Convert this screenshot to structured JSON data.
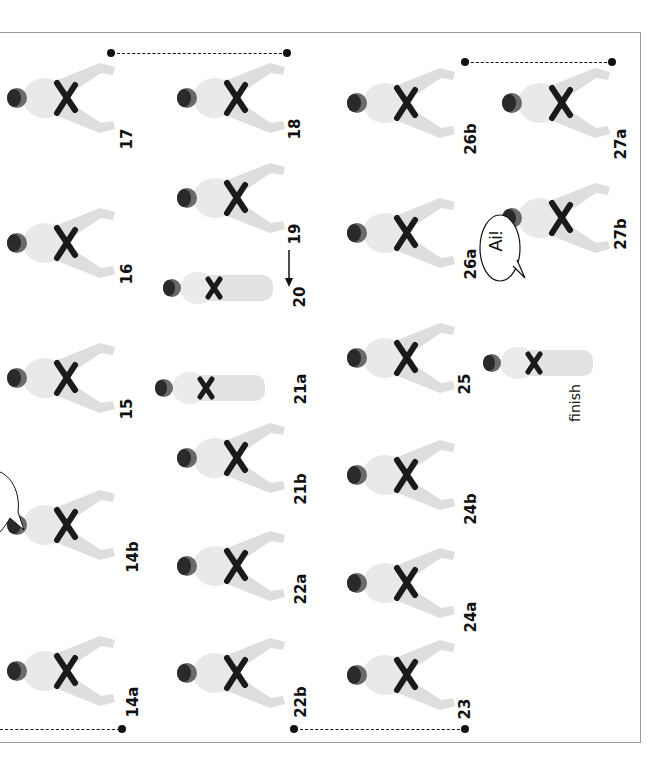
{
  "page": {
    "orientation": "rotated-90-clockwise",
    "figures": [
      {
        "id": "17",
        "label": "17",
        "x": 5,
        "y": 55,
        "lx": 117,
        "ly": 130
      },
      {
        "id": "16",
        "label": "16",
        "x": 5,
        "y": 200,
        "lx": 117,
        "ly": 265
      },
      {
        "id": "15",
        "label": "15",
        "x": 5,
        "y": 335,
        "lx": 117,
        "ly": 400
      },
      {
        "id": "14b",
        "label": "14b",
        "x": 5,
        "y": 482,
        "lx": 117,
        "ly": 548
      },
      {
        "id": "14a",
        "label": "14a",
        "x": 5,
        "y": 628,
        "lx": 117,
        "ly": 693
      },
      {
        "id": "18",
        "label": "18",
        "x": 175,
        "y": 55,
        "lx": 285,
        "ly": 120
      },
      {
        "id": "19",
        "label": "19",
        "x": 175,
        "y": 155,
        "lx": 285,
        "ly": 225
      },
      {
        "id": "20",
        "label": "20",
        "x": 158,
        "y": 245,
        "lx": 290,
        "ly": 288
      },
      {
        "id": "21a",
        "label": "21a",
        "x": 150,
        "y": 345,
        "lx": 285,
        "ly": 380
      },
      {
        "id": "21b",
        "label": "21b",
        "x": 175,
        "y": 415,
        "lx": 285,
        "ly": 480
      },
      {
        "id": "22a",
        "label": "22a",
        "x": 175,
        "y": 523,
        "lx": 285,
        "ly": 580
      },
      {
        "id": "22b",
        "label": "22b",
        "x": 175,
        "y": 630,
        "lx": 285,
        "ly": 693
      },
      {
        "id": "26b",
        "label": "26b",
        "x": 345,
        "y": 60,
        "lx": 455,
        "ly": 130
      },
      {
        "id": "26a",
        "label": "26a",
        "x": 345,
        "y": 190,
        "lx": 455,
        "ly": 255
      },
      {
        "id": "25",
        "label": "25",
        "x": 345,
        "y": 315,
        "lx": 455,
        "ly": 375
      },
      {
        "id": "24b",
        "label": "24b",
        "x": 345,
        "y": 432,
        "lx": 455,
        "ly": 500
      },
      {
        "id": "24a",
        "label": "24a",
        "x": 345,
        "y": 540,
        "lx": 455,
        "ly": 608
      },
      {
        "id": "23",
        "label": "23",
        "x": 345,
        "y": 632,
        "lx": 455,
        "ly": 700
      },
      {
        "id": "27a",
        "label": "27a",
        "x": 500,
        "y": 60,
        "lx": 605,
        "ly": 135
      },
      {
        "id": "27b",
        "label": "27b",
        "x": 500,
        "y": 175,
        "lx": 605,
        "ly": 225
      },
      {
        "id": "finish",
        "label": "finish",
        "x": 478,
        "y": 320,
        "lx": 556,
        "ly": 395
      }
    ],
    "speech_bubbles": [
      {
        "text": "Ai!",
        "near": "27b"
      },
      {
        "text": "",
        "near": "14b"
      }
    ],
    "movement_arrow": {
      "near": "20",
      "direction": "down"
    },
    "sequence_markers": [
      {
        "from": "17",
        "to": "18",
        "style": "dashed"
      },
      {
        "from": "26b",
        "to": "27a",
        "style": "dashed"
      },
      {
        "from": "14a",
        "to": "14a-end",
        "style": "dashed"
      },
      {
        "from": "22b",
        "to": "23",
        "style": "dashed"
      }
    ],
    "finish_label": "finish",
    "colors": {
      "ink": "#111111",
      "gi": "#e6e6e6",
      "belt": "#1a1a1a",
      "frame": "#9a9a9a"
    }
  }
}
